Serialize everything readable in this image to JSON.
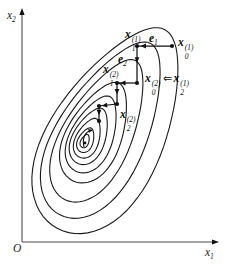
{
  "figure": {
    "background": "#ffffff",
    "ink_color": "#1a1a1a",
    "axis_color": "#4d4d4d"
  },
  "labels": {
    "y_axis": {
      "base": "x",
      "sub": "2"
    },
    "x_axis": {
      "base": "x",
      "sub": "1"
    },
    "origin": "O",
    "x1_1": {
      "base": "x",
      "sub": "1",
      "sup": "(1)"
    },
    "e1": {
      "base": "e",
      "sub": "1"
    },
    "x0_1": {
      "base": "x",
      "sub": "0",
      "sup": "(1)"
    },
    "e2": {
      "base": "e",
      "sub": "2"
    },
    "x1_2": {
      "base": "x",
      "sub": "1",
      "sup": "(2)"
    },
    "assign": {
      "left": {
        "base": "x",
        "sub": "0",
        "sup": "(2)"
      },
      "arrow": "⇐",
      "right": {
        "base": "x",
        "sub": "2",
        "sup": "(1)"
      }
    },
    "x2_2": {
      "base": "x",
      "sub": "2",
      "sup": "(2)"
    }
  },
  "diagram": {
    "egg_factor": 0.25,
    "contours": [
      {
        "cx": 85,
        "cy": 141,
        "a": 7,
        "b": 4,
        "rot": 67
      },
      {
        "cx": 86,
        "cy": 140,
        "a": 13,
        "b": 7.5,
        "rot": 67
      },
      {
        "cx": 88,
        "cy": 138,
        "a": 21,
        "b": 11.5,
        "rot": 67
      },
      {
        "cx": 90,
        "cy": 136,
        "a": 30,
        "b": 16,
        "rot": 66
      },
      {
        "cx": 93,
        "cy": 134,
        "a": 41,
        "b": 21,
        "rot": 66
      },
      {
        "cx": 96,
        "cy": 132,
        "a": 54,
        "b": 27,
        "rot": 65
      },
      {
        "cx": 100,
        "cy": 130,
        "a": 78,
        "b": 34,
        "rot": 63
      },
      {
        "cx": 105,
        "cy": 129,
        "a": 97,
        "b": 44,
        "rot": 62
      },
      {
        "cx": 111,
        "cy": 129,
        "a": 113,
        "b": 56,
        "rot": 61.5
      }
    ],
    "axes": {
      "y": {
        "x1": 22,
        "y1": 242,
        "x2": 22,
        "y2": 14,
        "tip": [
          22,
          8
        ],
        "dir": [
          0,
          -1
        ]
      },
      "x": {
        "x1": 22,
        "y1": 242,
        "x2": 213,
        "y2": 242,
        "tip": [
          219,
          242
        ],
        "dir": [
          1,
          0
        ]
      }
    },
    "segments": [
      {
        "x1": 172,
        "y1": 46,
        "x2": 137,
        "y2": 46,
        "arrow_t": 0.9
      },
      {
        "x1": 137,
        "y1": 46,
        "x2": 137,
        "y2": 83,
        "arrow_t": 0.45
      },
      {
        "x1": 137,
        "y1": 83,
        "x2": 117,
        "y2": 83,
        "arrow_t": 0.85
      },
      {
        "x1": 117,
        "y1": 83,
        "x2": 117,
        "y2": 104,
        "arrow_t": 0.55
      },
      {
        "x1": 117,
        "y1": 104,
        "x2": 99,
        "y2": 106,
        "arrow_t": 0.85
      },
      {
        "x1": 99,
        "y1": 106,
        "x2": 99,
        "y2": 121,
        "arrow_t": 0.62
      }
    ],
    "dots": [
      [
        172,
        46
      ],
      [
        137,
        46
      ],
      [
        137,
        83
      ],
      [
        117,
        83
      ],
      [
        117,
        104
      ],
      [
        99,
        106
      ],
      [
        99,
        121
      ],
      [
        85,
        143
      ]
    ],
    "center_arrow": {
      "d": "M 84 147 Q 81 133 92 130",
      "tip": [
        93,
        130
      ],
      "dir": [
        10,
        -2
      ]
    }
  }
}
